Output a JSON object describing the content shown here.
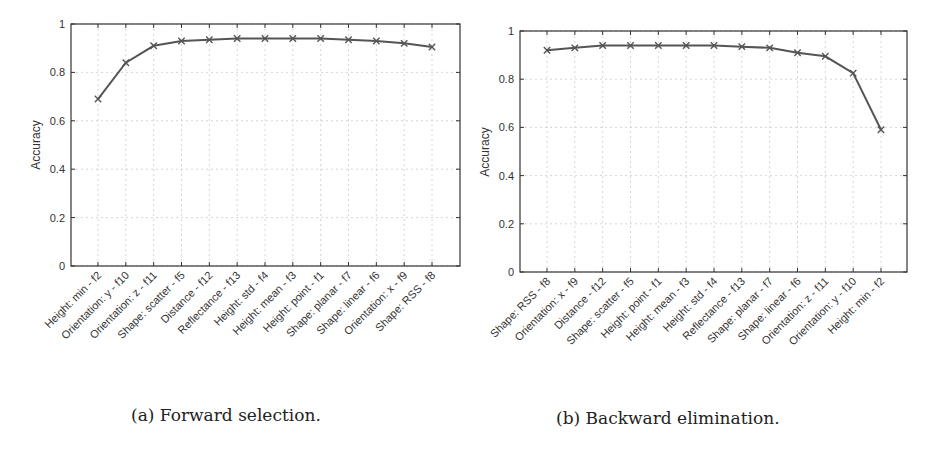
{
  "chart_data": [
    {
      "type": "line",
      "caption": "(a) Forward selection.",
      "title": "",
      "xlabel": "",
      "ylabel": "Accuracy",
      "ylim": [
        0,
        1
      ],
      "yticks": [
        "0",
        "0.2",
        "0.4",
        "0.6",
        "0.8",
        "1"
      ],
      "grid": true,
      "marker": "x",
      "categories": [
        "Height: min - f2",
        "Orientation: y - f10",
        "Orientation: z - f11",
        "Shape: scatter - f5",
        "Distance - f12",
        "Reflectance - f13",
        "Height: std - f4",
        "Height: mean - f3",
        "Height: point - f1",
        "Shape: planar - f7",
        "Shape: linear - f6",
        "Orientation: x - f9",
        "Shape: RSS - f8"
      ],
      "values": [
        0.69,
        0.84,
        0.91,
        0.93,
        0.935,
        0.94,
        0.94,
        0.94,
        0.94,
        0.935,
        0.93,
        0.92,
        0.905
      ]
    },
    {
      "type": "line",
      "caption": "(b) Backward elimination.",
      "title": "",
      "xlabel": "",
      "ylabel": "Accuracy",
      "ylim": [
        0,
        1
      ],
      "yticks": [
        "0",
        "0.2",
        "0.4",
        "0.6",
        "0.8",
        "1"
      ],
      "grid": true,
      "marker": "x",
      "categories": [
        "Shape: RSS - f8",
        "Orientation: x - f9",
        "Distance - f12",
        "Shape: scatter - f5",
        "Height: point - f1",
        "Height: mean - f3",
        "Height: std - f4",
        "Reflectance - f13",
        "Shape: planar - f7",
        "Shape: linear - f6",
        "Orientation: z - f11",
        "Orientation: y - f10",
        "Height: min - f2"
      ],
      "values": [
        0.92,
        0.93,
        0.94,
        0.94,
        0.94,
        0.94,
        0.94,
        0.935,
        0.93,
        0.91,
        0.895,
        0.825,
        0.59
      ]
    }
  ],
  "style": {
    "line_color": "#555555",
    "axis_color": "#333333",
    "grid_color": "#cccccc"
  }
}
